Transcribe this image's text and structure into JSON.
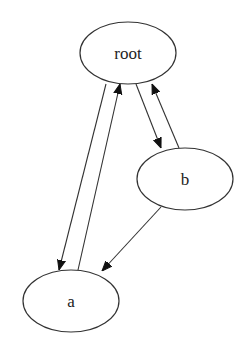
{
  "diagram": {
    "type": "directed-graph",
    "nodes": [
      {
        "id": "root",
        "label": "root",
        "cx": 128,
        "cy": 53,
        "rx": 48,
        "ry": 31
      },
      {
        "id": "b",
        "label": "b",
        "cx": 185,
        "cy": 179,
        "rx": 48,
        "ry": 31
      },
      {
        "id": "a",
        "label": "a",
        "cx": 71,
        "cy": 301,
        "rx": 48,
        "ry": 31
      }
    ],
    "edges": [
      {
        "from": "root",
        "to": "a"
      },
      {
        "from": "a",
        "to": "root"
      },
      {
        "from": "root",
        "to": "b"
      },
      {
        "from": "b",
        "to": "root"
      },
      {
        "from": "b",
        "to": "a"
      }
    ],
    "colors": {
      "background": "#ffffff",
      "stroke": "#333333",
      "arrow": "#111111",
      "text": "#222222"
    }
  }
}
